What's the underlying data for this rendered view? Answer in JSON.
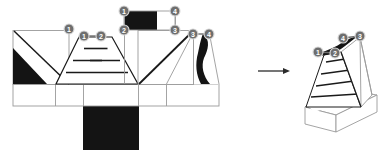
{
  "figure": {
    "type": "net-to-solid-folding-diagram",
    "panels": [
      {
        "id": "flat-net",
        "role": "unfolded 2D net / flat pattern"
      },
      {
        "id": "folded-solid",
        "role": "folded 3D solid result"
      }
    ],
    "transition": {
      "icon": "right-arrow-icon",
      "direction": "left-to-right"
    }
  },
  "colors": {
    "stroke": "#9a9a9a",
    "stroke_dark": "#1a1a1a",
    "fill_white": "#ffffff",
    "fill_black": "#141414",
    "node_fill": "#6e6e6e",
    "node_stroke": "#d9d9d9",
    "node_text": "#ffffff",
    "arrow": "#2b2b2b"
  },
  "net": {
    "label": "flat net",
    "base_strip": {
      "name": "base-strip",
      "x": 13,
      "y": 84,
      "width": 206,
      "height": 22,
      "divider_x": [
        55,
        83,
        138,
        166
      ]
    },
    "black_square": {
      "name": "base-underside-square",
      "x": 83,
      "y": 106,
      "width": 55,
      "height": 44,
      "fill": "#141414"
    },
    "faces": [
      {
        "name": "left-square-face",
        "shape": "square",
        "x": 13,
        "y": 30,
        "width": 55,
        "height": 54,
        "diagonal": "top-left to bottom-right",
        "black_triangle": true
      },
      {
        "name": "stepped-trapezoid-face",
        "shape": "trapezoid",
        "steps": 4,
        "top_left": 79,
        "top_right": 112,
        "bottom_left": 56,
        "bottom_right": 137,
        "top_y": 37,
        "bottom_y": 84,
        "step_y": [
          49,
          61,
          72
        ]
      },
      {
        "name": "right-square-face",
        "shape": "square",
        "x": 138,
        "y": 30,
        "width": 55,
        "height": 54,
        "diagonal": "bottom-left to top-right",
        "black_rect_top": true
      },
      {
        "name": "far-right-face",
        "shape": "triangle-with-petal",
        "x": 166,
        "y": 33,
        "width": 53,
        "height": 51,
        "black_petal": true
      }
    ],
    "nodes": [
      {
        "id": 1,
        "label": "1",
        "cx": 69,
        "cy": 29
      },
      {
        "id": 1,
        "label": "1",
        "cx": 84,
        "cy": 36
      },
      {
        "id": 2,
        "label": "2",
        "cx": 101,
        "cy": 36
      },
      {
        "id": 1,
        "label": "1",
        "cx": 124,
        "cy": 11
      },
      {
        "id": 4,
        "label": "4",
        "cx": 175,
        "cy": 11
      },
      {
        "id": 2,
        "label": "2",
        "cx": 124,
        "cy": 30
      },
      {
        "id": 3,
        "label": "3",
        "cx": 175,
        "cy": 30
      },
      {
        "id": 3,
        "label": "3",
        "cx": 193,
        "cy": 34
      },
      {
        "id": 4,
        "label": "4",
        "cx": 209,
        "cy": 34
      }
    ]
  },
  "solid": {
    "label": "folded solid",
    "base": {
      "name": "solid-base-slab",
      "front": [
        [
          310,
          117
        ],
        [
          430,
          117
        ]
      ],
      "height": 22
    },
    "steps": 4,
    "nodes": [
      {
        "id": 1,
        "label": "1",
        "cx": 318,
        "cy": 52
      },
      {
        "id": 2,
        "label": "2",
        "cx": 335,
        "cy": 53
      },
      {
        "id": 4,
        "label": "4",
        "cx": 343,
        "cy": 38
      },
      {
        "id": 3,
        "label": "3",
        "cx": 360,
        "cy": 36
      }
    ],
    "black_petal": true
  }
}
